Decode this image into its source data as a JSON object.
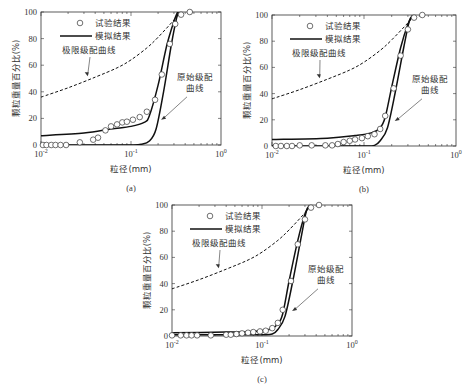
{
  "figure": {
    "y_label": "颗粒重量百分比(%)",
    "x_label": "粒径(mm)",
    "legend": {
      "marker_label": "试验结果",
      "line_label": "模拟结果"
    },
    "annotations": {
      "limit_curve": "极限级配曲线",
      "original_curve_line1": "原始级配",
      "original_curve_line2": "曲线"
    },
    "x_ticks": [
      "10^-2",
      "10^-1",
      "10^0"
    ],
    "y_ticks": [
      "0",
      "20",
      "40",
      "60",
      "80",
      "100"
    ]
  },
  "chart_data": [
    {
      "id": "a",
      "caption": "(a)",
      "type": "line",
      "xlabel": "粒径(mm)",
      "ylabel": "颗粒重量百分比(%)",
      "xscale": "log",
      "xlim": [
        0.01,
        1
      ],
      "ylim": [
        0,
        100
      ],
      "series": [
        {
          "name": "试验结果",
          "style": "marker-circle",
          "x": [
            0.0105,
            0.0115,
            0.013,
            0.0145,
            0.0165,
            0.019,
            0.027,
            0.038,
            0.043,
            0.052,
            0.06,
            0.07,
            0.08,
            0.09,
            0.105,
            0.125,
            0.15,
            0.185,
            0.22,
            0.27,
            0.31,
            0.36,
            0.45
          ],
          "y": [
            0,
            0,
            0,
            0,
            0,
            0,
            2,
            4,
            5.5,
            11,
            14,
            15.5,
            17,
            17.5,
            19,
            21,
            25,
            34,
            53,
            76,
            91,
            98,
            100
          ]
        },
        {
          "name": "模拟结果 (upper)",
          "style": "solid",
          "x": [
            0.01,
            0.03,
            0.06,
            0.1,
            0.14,
            0.16,
            0.2,
            0.25,
            0.3,
            0.33
          ],
          "y": [
            7,
            9,
            12,
            14,
            17,
            22,
            45,
            75,
            93,
            100
          ]
        },
        {
          "name": "原始级配曲线",
          "style": "solid",
          "x": [
            0.01,
            0.05,
            0.1,
            0.13,
            0.16,
            0.19,
            0.23,
            0.28,
            0.32,
            0.34
          ],
          "y": [
            0,
            0,
            0,
            0.5,
            3,
            12,
            40,
            75,
            95,
            100
          ]
        },
        {
          "name": "极限级配曲线",
          "style": "dashed",
          "x": [
            0.01,
            0.02,
            0.04,
            0.07,
            0.1,
            0.15,
            0.2,
            0.3,
            0.35
          ],
          "y": [
            36,
            43,
            51,
            58,
            64,
            73,
            81,
            94,
            100
          ]
        }
      ]
    },
    {
      "id": "b",
      "caption": "(b)",
      "type": "line",
      "xlabel": "粒径(mm)",
      "ylabel": "颗粒重量百分比(%)",
      "xscale": "log",
      "xlim": [
        0.01,
        1
      ],
      "ylim": [
        0,
        100
      ],
      "series": [
        {
          "name": "试验结果",
          "style": "marker-circle",
          "x": [
            0.011,
            0.0125,
            0.0145,
            0.0165,
            0.02,
            0.027,
            0.038,
            0.045,
            0.052,
            0.06,
            0.07,
            0.08,
            0.095,
            0.11,
            0.13,
            0.15,
            0.17,
            0.21,
            0.25,
            0.3,
            0.35,
            0.43
          ],
          "y": [
            0,
            0,
            0,
            0,
            0.5,
            0.5,
            0.5,
            0.5,
            1.5,
            3,
            4,
            5,
            6,
            7.5,
            9,
            13,
            23,
            44,
            69,
            89,
            98,
            100
          ]
        },
        {
          "name": "模拟结果 (upper)",
          "style": "solid",
          "x": [
            0.01,
            0.04,
            0.08,
            0.12,
            0.15,
            0.17,
            0.2,
            0.25,
            0.3,
            0.34
          ],
          "y": [
            5,
            6,
            8,
            10,
            14,
            22,
            45,
            75,
            93,
            100
          ]
        },
        {
          "name": "原始级配曲线",
          "style": "solid",
          "x": [
            0.01,
            0.05,
            0.1,
            0.13,
            0.15,
            0.18,
            0.22,
            0.27,
            0.31,
            0.34
          ],
          "y": [
            0,
            0,
            0,
            0.5,
            4,
            14,
            42,
            75,
            95,
            100
          ]
        },
        {
          "name": "极限级配曲线",
          "style": "dashed",
          "x": [
            0.01,
            0.02,
            0.04,
            0.07,
            0.1,
            0.15,
            0.2,
            0.3,
            0.35
          ],
          "y": [
            36,
            43,
            51,
            58,
            64,
            73,
            81,
            94,
            100
          ]
        }
      ]
    },
    {
      "id": "c",
      "caption": "(c)",
      "type": "line",
      "xlabel": "粒径(mm)",
      "ylabel": "颗粒重量百分比(%)",
      "xscale": "log",
      "xlim": [
        0.01,
        1
      ],
      "ylim": [
        0,
        100
      ],
      "series": [
        {
          "name": "试验结果",
          "style": "marker-circle",
          "x": [
            0.01,
            0.0125,
            0.0145,
            0.0165,
            0.019,
            0.027,
            0.04,
            0.045,
            0.052,
            0.06,
            0.07,
            0.08,
            0.095,
            0.11,
            0.13,
            0.15,
            0.17,
            0.21,
            0.25,
            0.3,
            0.35,
            0.43
          ],
          "y": [
            0.5,
            0.5,
            0.5,
            0.5,
            0.5,
            0.5,
            1,
            1,
            1.5,
            2,
            2.5,
            3,
            3.5,
            4,
            6,
            10,
            20,
            42,
            70,
            89,
            98,
            100
          ]
        },
        {
          "name": "模拟结果 (upper)",
          "style": "solid",
          "x": [
            0.01,
            0.04,
            0.08,
            0.12,
            0.15,
            0.17,
            0.2,
            0.25,
            0.3,
            0.34
          ],
          "y": [
            2.5,
            3,
            3.5,
            5,
            9,
            17,
            42,
            73,
            93,
            100
          ]
        },
        {
          "name": "原始级配曲线",
          "style": "solid",
          "x": [
            0.01,
            0.05,
            0.1,
            0.13,
            0.15,
            0.18,
            0.22,
            0.27,
            0.31,
            0.34
          ],
          "y": [
            1,
            1,
            1,
            1.5,
            5,
            15,
            42,
            74,
            95,
            100
          ]
        },
        {
          "name": "极限级配曲线",
          "style": "dashed",
          "x": [
            0.01,
            0.02,
            0.04,
            0.07,
            0.1,
            0.15,
            0.2,
            0.3,
            0.35
          ],
          "y": [
            36,
            43,
            51,
            58,
            64,
            73,
            81,
            94,
            100
          ]
        }
      ]
    }
  ],
  "layout": [
    {
      "left": 41,
      "top": 12,
      "right": 221,
      "bottom": 145,
      "legendX": 80,
      "legendY": 23
    },
    {
      "left": 272,
      "top": 15,
      "right": 456,
      "bottom": 146,
      "legendX": 310,
      "legendY": 26
    },
    {
      "left": 172,
      "top": 205,
      "right": 352,
      "bottom": 336,
      "legendX": 210,
      "legendY": 216
    }
  ]
}
